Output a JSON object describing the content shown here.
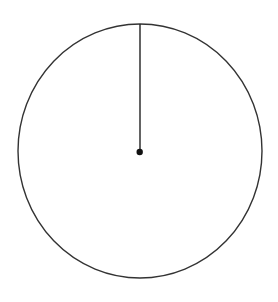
{
  "diagram": {
    "type": "circle-with-radius",
    "circle": {
      "cx": 140,
      "cy": 151,
      "rx": 122,
      "ry": 127,
      "stroke": "#333333",
      "stroke_width": 1.4
    },
    "radius_line": {
      "x1": 140,
      "y1": 24,
      "x2": 140,
      "y2": 152,
      "stroke": "#222222",
      "stroke_width": 1.4
    },
    "center_point": {
      "cx": 139.7,
      "cy": 152,
      "r": 3.2,
      "fill": "#111111"
    }
  }
}
